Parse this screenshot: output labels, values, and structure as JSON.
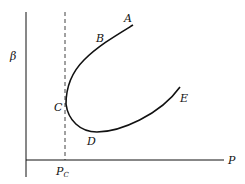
{
  "diagram": {
    "type": "curve-sketch",
    "axes": {
      "x_label": "P",
      "y_label": "β",
      "x_marker": {
        "label": "P",
        "subscript": "C"
      }
    },
    "points": [
      {
        "id": "A",
        "label": "A"
      },
      {
        "id": "B",
        "label": "B"
      },
      {
        "id": "C",
        "label": "C"
      },
      {
        "id": "D",
        "label": "D"
      },
      {
        "id": "E",
        "label": "E"
      }
    ],
    "colors": {
      "line": "#111111",
      "background": "#ffffff"
    }
  }
}
